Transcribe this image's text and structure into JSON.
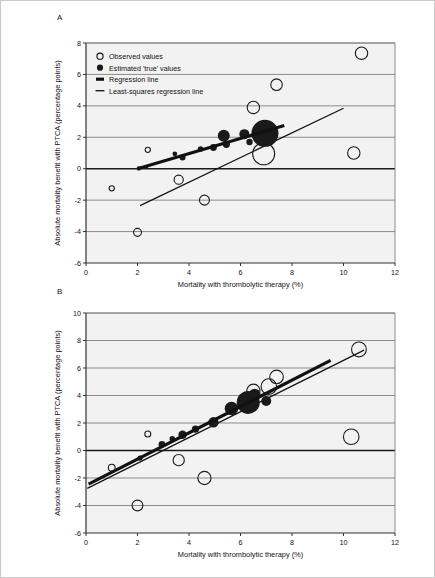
{
  "figure": {
    "panels": [
      {
        "id": "A",
        "label": "A"
      },
      {
        "id": "B",
        "label": "B"
      }
    ],
    "border_color": "#c9c9c9"
  },
  "legend": {
    "position": "top-left",
    "items": [
      {
        "key": "observed",
        "label": "Observed values",
        "marker": "open-circle"
      },
      {
        "key": "estimated",
        "label": "Estimated 'true' values",
        "marker": "filled-circle"
      },
      {
        "key": "regression",
        "label": "Regression line",
        "marker": "thick-line"
      },
      {
        "key": "leastsquares",
        "label": "Least-squares regression line",
        "marker": "thin-line"
      }
    ]
  },
  "style": {
    "plot_background": "#f2f2f2",
    "gridline_color": "#808080",
    "axis_color": "#333333",
    "marker_fill": "#1a1a1a",
    "marker_stroke": "#1a1a1a",
    "zero_line_color": "#1a1a1a"
  },
  "chart_data": [
    {
      "panel": "A",
      "type": "scatter",
      "title": "",
      "xlabel": "Mortality with thrombolytic therapy (%)",
      "ylabel": "Absolute mortality benefit with PTCA (percentage points)",
      "xlim": [
        0,
        12
      ],
      "ylim": [
        -6,
        8
      ],
      "xticks": [
        0,
        2,
        4,
        6,
        8,
        10,
        12
      ],
      "yticks": [
        -6,
        -4,
        -2,
        0,
        2,
        4,
        6,
        8
      ],
      "grid": true,
      "legend_position": "top-left",
      "series": [
        {
          "name": "Observed values",
          "marker": "open-circle",
          "points": [
            {
              "x": 1.0,
              "y": -1.25,
              "r": 2.6
            },
            {
              "x": 2.0,
              "y": -4.05,
              "r": 4.0
            },
            {
              "x": 2.4,
              "y": 1.2,
              "r": 2.6
            },
            {
              "x": 3.6,
              "y": -0.7,
              "r": 4.6
            },
            {
              "x": 4.6,
              "y": -2.0,
              "r": 5.0
            },
            {
              "x": 6.5,
              "y": 3.9,
              "r": 6.2
            },
            {
              "x": 6.9,
              "y": 0.95,
              "r": 11.0
            },
            {
              "x": 7.4,
              "y": 5.35,
              "r": 5.8
            },
            {
              "x": 10.4,
              "y": 1.0,
              "r": 6.2
            },
            {
              "x": 10.7,
              "y": 7.35,
              "r": 6.2
            }
          ]
        },
        {
          "name": "Estimated 'true' values",
          "marker": "filled-circle",
          "points": [
            {
              "x": 2.05,
              "y": 0.02,
              "r": 2.2
            },
            {
              "x": 2.35,
              "y": 0.12,
              "r": 1.8
            },
            {
              "x": 3.45,
              "y": 0.95,
              "r": 2.4
            },
            {
              "x": 3.75,
              "y": 0.72,
              "r": 3.0
            },
            {
              "x": 4.45,
              "y": 1.25,
              "r": 2.8
            },
            {
              "x": 4.95,
              "y": 1.35,
              "r": 3.4
            },
            {
              "x": 5.35,
              "y": 2.1,
              "r": 6.0
            },
            {
              "x": 5.45,
              "y": 1.55,
              "r": 3.6
            },
            {
              "x": 6.15,
              "y": 2.2,
              "r": 5.0
            },
            {
              "x": 6.35,
              "y": 1.7,
              "r": 3.2
            },
            {
              "x": 6.95,
              "y": 2.25,
              "r": 13.5
            }
          ]
        }
      ],
      "lines": [
        {
          "name": "Regression line",
          "style": "thick",
          "x1": 2.0,
          "y1": 0.0,
          "x2": 7.7,
          "y2": 2.75
        },
        {
          "name": "Least-squares regression line",
          "style": "thin",
          "x1": 2.1,
          "y1": -2.35,
          "x2": 10.0,
          "y2": 3.85
        }
      ]
    },
    {
      "panel": "B",
      "type": "scatter",
      "title": "",
      "xlabel": "Mortality with thrombolytic therapy (%)",
      "ylabel": "Absolute mortality benefit with PTCA (percentage points)",
      "xlim": [
        0,
        12
      ],
      "ylim": [
        -6,
        10
      ],
      "xticks": [
        0,
        2,
        4,
        6,
        8,
        10,
        12
      ],
      "yticks": [
        -6,
        -4,
        -2,
        0,
        2,
        4,
        6,
        8,
        10
      ],
      "grid": true,
      "legend_position": "none",
      "series": [
        {
          "name": "Observed values",
          "marker": "open-circle",
          "points": [
            {
              "x": 1.0,
              "y": -1.25,
              "r": 3.4
            },
            {
              "x": 2.0,
              "y": -4.0,
              "r": 5.4
            },
            {
              "x": 2.4,
              "y": 1.2,
              "r": 3.0
            },
            {
              "x": 3.6,
              "y": -0.7,
              "r": 5.6
            },
            {
              "x": 4.6,
              "y": -2.0,
              "r": 6.6
            },
            {
              "x": 6.5,
              "y": 4.35,
              "r": 6.6
            },
            {
              "x": 7.1,
              "y": 4.65,
              "r": 7.8
            },
            {
              "x": 7.4,
              "y": 5.35,
              "r": 6.8
            },
            {
              "x": 10.3,
              "y": 1.0,
              "r": 7.8
            },
            {
              "x": 10.6,
              "y": 7.35,
              "r": 7.4
            }
          ]
        },
        {
          "name": "Estimated 'true' values",
          "marker": "filled-circle",
          "points": [
            {
              "x": 2.1,
              "y": -0.55,
              "r": 2.6
            },
            {
              "x": 2.95,
              "y": 0.45,
              "r": 3.4
            },
            {
              "x": 3.35,
              "y": 0.85,
              "r": 2.8
            },
            {
              "x": 3.75,
              "y": 1.15,
              "r": 4.2
            },
            {
              "x": 4.25,
              "y": 1.55,
              "r": 3.6
            },
            {
              "x": 4.95,
              "y": 2.05,
              "r": 5.2
            },
            {
              "x": 5.65,
              "y": 3.05,
              "r": 6.8
            },
            {
              "x": 6.3,
              "y": 3.5,
              "r": 11.5
            },
            {
              "x": 6.55,
              "y": 4.05,
              "r": 6.0
            },
            {
              "x": 7.0,
              "y": 3.6,
              "r": 5.0
            }
          ]
        }
      ],
      "lines": [
        {
          "name": "Regression line",
          "style": "thick",
          "x1": 0.1,
          "y1": -2.45,
          "x2": 9.5,
          "y2": 6.55
        },
        {
          "name": "Least-squares regression line",
          "style": "thin",
          "x1": 0.05,
          "y1": -2.75,
          "x2": 10.8,
          "y2": 7.3
        }
      ]
    }
  ]
}
